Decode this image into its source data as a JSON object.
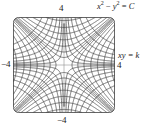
{
  "figure": {
    "title": "",
    "axis_labels": {
      "top": "4",
      "bottom": "−4",
      "left": "−4",
      "right": "4"
    },
    "equations": {
      "family_c_var": "x",
      "family_c_exp1": "2",
      "family_c_minus": " − ",
      "family_c_var2": "y",
      "family_c_exp2": "2",
      "family_c_eq": " = ",
      "family_c_const": "C",
      "family_k": "xy = k"
    },
    "colors": {
      "curve": "#3c3c3c",
      "frame": "#555555",
      "axis": "#8a8a8a",
      "background": "#ffffff",
      "text": "#1a1a1a"
    }
  },
  "chart_data": {
    "type": "line",
    "xlabel": "x",
    "ylabel": "y",
    "xlim": [
      -4,
      4
    ],
    "ylim": [
      -4,
      4
    ],
    "xticks": [
      -4,
      4
    ],
    "yticks": [
      -4,
      4
    ],
    "xticklabels": [
      "−4",
      "4"
    ],
    "yticklabels": [
      "−4",
      "4"
    ],
    "grid": false,
    "legend": "none",
    "annotations": [
      {
        "text": "x² − y² = C",
        "x": 4.2,
        "y": 4.6
      },
      {
        "text": "xy = k",
        "x": 4.4,
        "y": 0.6
      }
    ],
    "series": [
      {
        "name": "x^2 - y^2 = C",
        "equation": "x^2 - y^2 = C",
        "constants": [
          -14,
          -10,
          -7,
          -4.5,
          -2.5,
          -1.2,
          -0.4,
          0.4,
          1.2,
          2.5,
          4.5,
          7,
          10,
          14
        ],
        "constant_symbol": "C",
        "count": 14
      },
      {
        "name": "xy = k",
        "equation": "xy = k",
        "constants": [
          -7,
          -5,
          -3.5,
          -2.25,
          -1.25,
          -0.6,
          -0.2,
          0.2,
          0.6,
          1.25,
          2.25,
          3.5,
          5,
          7
        ],
        "constant_symbol": "k",
        "count": 14
      }
    ]
  }
}
